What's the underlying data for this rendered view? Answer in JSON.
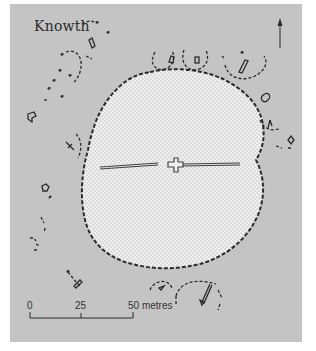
{
  "title": "Knowth",
  "north_arrow": {
    "icon": "north-arrow-icon"
  },
  "scale_bar": {
    "ticks": [
      "0",
      "25",
      "50 metres"
    ],
    "unit": "metres"
  },
  "features": {
    "main_mound": "central passage tomb with two passages (east and west)",
    "satellite_tombs": "smaller surrounding passage tombs and kerb fragments"
  },
  "colors": {
    "background": "#c4c4c4",
    "mound_fill": "#efefef",
    "outline": "#2a2a2a"
  }
}
